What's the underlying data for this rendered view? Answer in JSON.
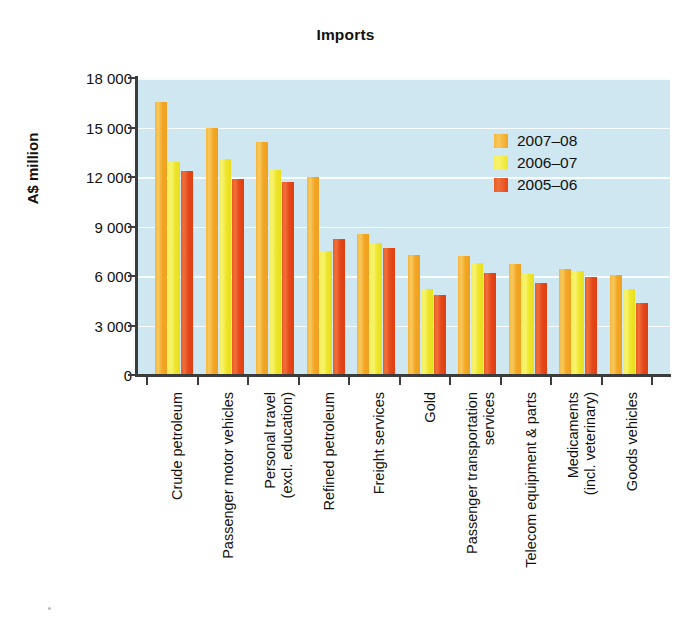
{
  "chart_data": {
    "type": "bar",
    "title": "Imports",
    "xlabel": "",
    "ylabel": "A$ million",
    "ylim": [
      0,
      18000
    ],
    "yticks": [
      0,
      3000,
      6000,
      9000,
      12000,
      15000,
      18000
    ],
    "ytick_labels": [
      "0",
      "3 000",
      "6 000",
      "9 000",
      "12 000",
      "15 000",
      "18 000"
    ],
    "grid": true,
    "legend_position": "upper-right",
    "orientation": "vertical",
    "categories": [
      "Crude petroleum",
      "Passenger motor vehicles",
      "Personal travel (excl. education)",
      "Refined petroleum",
      "Freight services",
      "Gold",
      "Passenger transportation services",
      "Telecom equipment & parts",
      "Medicaments (incl. veterinary)",
      "Goods vehicles"
    ],
    "category_lines": [
      [
        "Crude petroleum"
      ],
      [
        "Passenger motor vehicles"
      ],
      [
        "Personal travel",
        "(excl. education)"
      ],
      [
        "Refined petroleum"
      ],
      [
        "Freight services"
      ],
      [
        "Gold"
      ],
      [
        "Passenger transportation",
        "services"
      ],
      [
        "Telecom equipment & parts"
      ],
      [
        "Medicaments",
        "(incl. veterinary)"
      ],
      [
        "Goods vehicles"
      ]
    ],
    "series": [
      {
        "name": "2007-08",
        "label": "2007–08",
        "color": "#f2a623",
        "values": [
          16550,
          14950,
          14100,
          12000,
          8550,
          7270,
          7200,
          6700,
          6450,
          6050
        ]
      },
      {
        "name": "2006-07",
        "label": "2006–07",
        "color": "#eee52a",
        "values": [
          12900,
          13100,
          12400,
          7500,
          8000,
          5200,
          6800,
          6150,
          6300,
          5200
        ]
      },
      {
        "name": "2005-06",
        "label": "2005–06",
        "color": "#e5481a",
        "values": [
          12350,
          11900,
          11700,
          8250,
          7700,
          4850,
          6200,
          5600,
          5950,
          4350
        ]
      }
    ]
  },
  "plot_background_color": "#cfe7f1",
  "axis_color": "#3c3c3c",
  "gridline_color": "#ffffff"
}
